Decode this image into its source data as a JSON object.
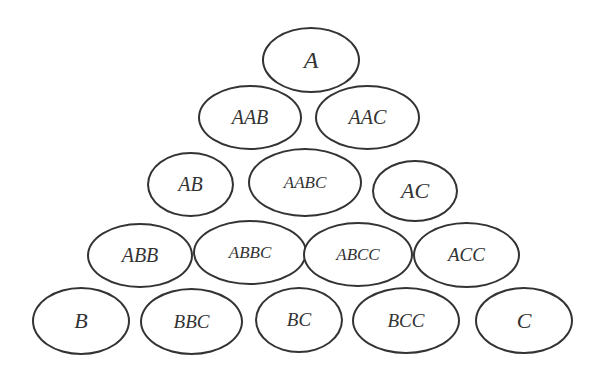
{
  "diagram": {
    "type": "triangular-ellipse-lattice",
    "stroke_color": "#333333",
    "background": "#ffffff",
    "rows": [
      {
        "nodes": [
          {
            "label": "A",
            "x": 262,
            "y": 27,
            "w": 98,
            "h": 66,
            "fs": 24
          }
        ]
      },
      {
        "nodes": [
          {
            "label": "AAB",
            "x": 198,
            "y": 85,
            "w": 104,
            "h": 65,
            "fs": 20
          },
          {
            "label": "AAC",
            "x": 315,
            "y": 85,
            "w": 105,
            "h": 65,
            "fs": 20
          }
        ]
      },
      {
        "nodes": [
          {
            "label": "AB",
            "x": 147,
            "y": 152,
            "w": 87,
            "h": 65,
            "fs": 20
          },
          {
            "label": "AABC",
            "x": 248,
            "y": 148,
            "w": 114,
            "h": 69,
            "fs": 17
          },
          {
            "label": "AC",
            "x": 372,
            "y": 160,
            "w": 86,
            "h": 62,
            "fs": 22
          }
        ]
      },
      {
        "nodes": [
          {
            "label": "ABB",
            "x": 87,
            "y": 223,
            "w": 106,
            "h": 65,
            "fs": 20
          },
          {
            "label": "ABBC",
            "x": 193,
            "y": 220,
            "w": 114,
            "h": 65,
            "fs": 17
          },
          {
            "label": "ABCC",
            "x": 303,
            "y": 222,
            "w": 110,
            "h": 65,
            "fs": 17
          },
          {
            "label": "ACC",
            "x": 413,
            "y": 222,
            "w": 107,
            "h": 66,
            "fs": 19
          }
        ]
      },
      {
        "nodes": [
          {
            "label": "B",
            "x": 32,
            "y": 287,
            "w": 98,
            "h": 68,
            "fs": 22
          },
          {
            "label": "BBC",
            "x": 140,
            "y": 288,
            "w": 103,
            "h": 67,
            "fs": 19
          },
          {
            "label": "BC",
            "x": 255,
            "y": 287,
            "w": 88,
            "h": 66,
            "fs": 19
          },
          {
            "label": "BCC",
            "x": 352,
            "y": 287,
            "w": 108,
            "h": 67,
            "fs": 19
          },
          {
            "label": "C",
            "x": 475,
            "y": 287,
            "w": 98,
            "h": 67,
            "fs": 22
          }
        ]
      }
    ]
  }
}
